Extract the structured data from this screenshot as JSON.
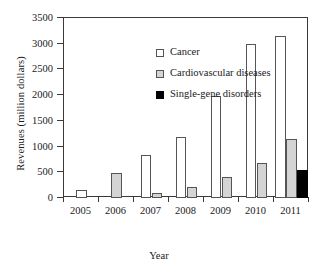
{
  "chart_data": {
    "type": "bar",
    "title": "",
    "xlabel": "Year",
    "ylabel": "Revenues (million dollars)",
    "categories": [
      "2005",
      "2006",
      "2007",
      "2008",
      "2009",
      "2010",
      "2011"
    ],
    "series": [
      {
        "name": "Cancer",
        "color": "#ffffff",
        "values": [
          150,
          0,
          830,
          1190,
          1990,
          2990,
          3150
        ]
      },
      {
        "name": "Cardiovascular diseases",
        "color": "#d4d4d4",
        "values": [
          0,
          490,
          90,
          210,
          400,
          680,
          1140
        ]
      },
      {
        "name": "Single-gene disorders",
        "color": "#000000",
        "values": [
          0,
          0,
          0,
          0,
          0,
          0,
          545
        ]
      }
    ],
    "ylim": [
      0,
      3500
    ],
    "yticks": [
      "0",
      "500",
      "1000",
      "1500",
      "2000",
      "2500",
      "3000",
      "3500"
    ],
    "ytick_values": [
      0,
      500,
      1000,
      1500,
      2000,
      2500,
      3000,
      3500
    ],
    "grid": false,
    "legend_position": "top-left"
  },
  "legend": {
    "items": [
      {
        "label": "Cancer",
        "swatch": "cancer-swatch"
      },
      {
        "label": "Cardiovascular diseases",
        "swatch": "cvd-swatch"
      },
      {
        "label": "Single-gene disorders",
        "swatch": "sgd-swatch"
      }
    ]
  }
}
